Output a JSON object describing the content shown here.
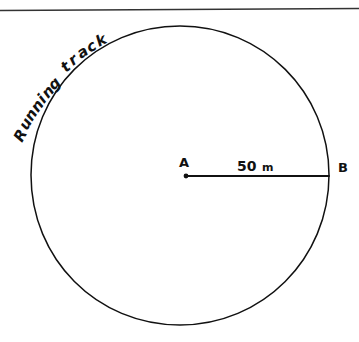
{
  "figure": {
    "background_color": "#ffffff",
    "ink_color": "#111111",
    "top_rule": {
      "present": true,
      "color": "#333333"
    },
    "circle": {
      "name": "running-track-circle",
      "center_x": 180,
      "center_y": 175,
      "radius_px": 149,
      "stroke_color": "#111111",
      "fill": "none"
    },
    "center_point": {
      "label": "A",
      "x": 185,
      "y": 176
    },
    "edge_point": {
      "label": "B",
      "x": 329,
      "y": 176
    },
    "radius_line": {
      "name": "radius-segment-ab",
      "x1": 185,
      "y1": 176,
      "x2": 329,
      "y2": 176
    },
    "dimension": {
      "value": "50",
      "unit": "m",
      "full_text": "50 m"
    },
    "track_label": {
      "text": "Running track",
      "characters": [
        "R",
        "u",
        "n",
        "n",
        "i",
        "n",
        "g",
        " ",
        "t",
        "r",
        "a",
        "c",
        "k"
      ]
    }
  }
}
